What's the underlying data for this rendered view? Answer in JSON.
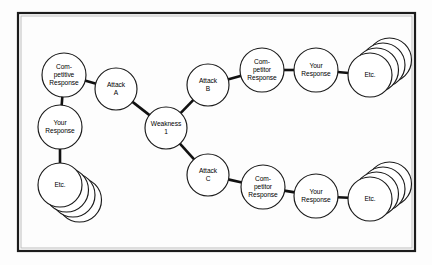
{
  "diagram": {
    "type": "node-link-diagram",
    "frame": {
      "x": 18,
      "y": 13,
      "width": 397,
      "height": 238,
      "border_color": "#1c1c1c",
      "background_color": "#fdfdfd"
    },
    "colors": {
      "node_fill": "#ffffff",
      "node_stroke": "#1a1a1a",
      "connector": "#111111",
      "text": "#000000"
    },
    "nodes": [
      {
        "id": "competitive-response",
        "lines": [
          "Com-",
          "petitive",
          "Response"
        ],
        "cx": 64,
        "cy": 75,
        "r": 22,
        "stack": 0
      },
      {
        "id": "your-response-left",
        "lines": [
          "Your",
          "Response"
        ],
        "cx": 60,
        "cy": 127,
        "r": 22,
        "stack": 0
      },
      {
        "id": "etc-left",
        "lines": [
          "Etc."
        ],
        "cx": 60,
        "cy": 185,
        "r": 22,
        "stack": 3,
        "stack_dir": "down-right"
      },
      {
        "id": "attack-a",
        "lines": [
          "Attack",
          "A"
        ],
        "cx": 116,
        "cy": 89,
        "r": 21,
        "stack": 0
      },
      {
        "id": "weakness-1",
        "lines": [
          "Weakness",
          "1"
        ],
        "cx": 166,
        "cy": 128,
        "r": 21,
        "stack": 0
      },
      {
        "id": "attack-b",
        "lines": [
          "Attack",
          "B"
        ],
        "cx": 208,
        "cy": 85,
        "r": 21,
        "stack": 0
      },
      {
        "id": "competitor-response-top",
        "lines": [
          "Com-",
          "petitor",
          "Response"
        ],
        "cx": 262,
        "cy": 70,
        "r": 22,
        "stack": 0
      },
      {
        "id": "your-response-top",
        "lines": [
          "Your",
          "Response"
        ],
        "cx": 316,
        "cy": 70,
        "r": 22,
        "stack": 0
      },
      {
        "id": "etc-top",
        "lines": [
          "Etc."
        ],
        "cx": 370,
        "cy": 75,
        "r": 22,
        "stack": 3,
        "stack_dir": "up-right"
      },
      {
        "id": "attack-c",
        "lines": [
          "Attack",
          "C"
        ],
        "cx": 208,
        "cy": 175,
        "r": 21,
        "stack": 0
      },
      {
        "id": "competitor-response-bottom",
        "lines": [
          "Com-",
          "petitor",
          "Response"
        ],
        "cx": 263,
        "cy": 187,
        "r": 22,
        "stack": 0
      },
      {
        "id": "your-response-bottom",
        "lines": [
          "Your",
          "Response"
        ],
        "cx": 316,
        "cy": 196,
        "r": 22,
        "stack": 0
      },
      {
        "id": "etc-bottom",
        "lines": [
          "Etc."
        ],
        "cx": 370,
        "cy": 199,
        "r": 22,
        "stack": 3,
        "stack_dir": "up-right"
      }
    ],
    "edges": [
      {
        "id": "edge-competitive-to-attack-a",
        "from": "competitive-response",
        "to": "attack-a"
      },
      {
        "id": "edge-competitive-to-your-response",
        "from": "competitive-response",
        "to": "your-response-left"
      },
      {
        "id": "edge-your-response-to-etc",
        "from": "your-response-left",
        "to": "etc-left"
      },
      {
        "id": "edge-attack-a-to-weakness",
        "from": "attack-a",
        "to": "weakness-1"
      },
      {
        "id": "edge-weakness-to-attack-b",
        "from": "weakness-1",
        "to": "attack-b"
      },
      {
        "id": "edge-weakness-to-attack-c",
        "from": "weakness-1",
        "to": "attack-c"
      },
      {
        "id": "edge-attack-b-to-competitor",
        "from": "attack-b",
        "to": "competitor-response-top"
      },
      {
        "id": "edge-competitor-to-your-top",
        "from": "competitor-response-top",
        "to": "your-response-top"
      },
      {
        "id": "edge-your-top-to-etc",
        "from": "your-response-top",
        "to": "etc-top"
      },
      {
        "id": "edge-attack-c-to-competitor",
        "from": "attack-c",
        "to": "competitor-response-bottom"
      },
      {
        "id": "edge-competitor-to-your-bottom",
        "from": "competitor-response-bottom",
        "to": "your-response-bottom"
      },
      {
        "id": "edge-your-bottom-to-etc",
        "from": "your-response-bottom",
        "to": "etc-bottom"
      }
    ]
  }
}
